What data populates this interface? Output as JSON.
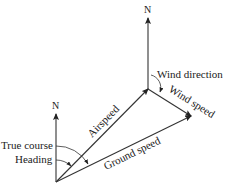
{
  "diagram": {
    "type": "vector-navigation",
    "labels": {
      "north_left": "N",
      "north_top": "N",
      "airspeed": "Airspeed",
      "ground_speed": "Ground speed",
      "wind_speed": "Wind speed",
      "wind_direction": "Wind direction",
      "true_course": "True course",
      "heading": "Heading"
    },
    "colors": {
      "line": "#333333",
      "text": "#222222",
      "background": "#ffffff"
    }
  }
}
